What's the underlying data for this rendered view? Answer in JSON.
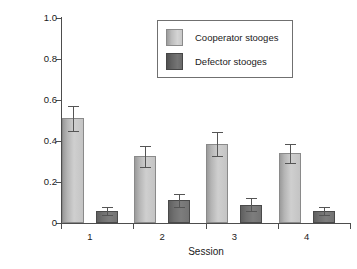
{
  "chart_data": {
    "type": "bar",
    "title": "",
    "xlabel": "Session",
    "ylabel": "Frequency of pulls",
    "categories": [
      "1",
      "2",
      "3",
      "4"
    ],
    "ylim": [
      0,
      1.0
    ],
    "ytick_labels": [
      "0",
      "0.2",
      "0.4",
      "0.6",
      "0.8",
      "1.0"
    ],
    "ytick_values": [
      0,
      0.2,
      0.4,
      0.6,
      0.8,
      1.0
    ],
    "grid": false,
    "legend_position": "upper center",
    "error_bars": "standard error",
    "series": [
      {
        "name": "Cooperator stooges",
        "color": "#c6c6c6",
        "values": [
          0.51,
          0.325,
          0.385,
          0.34
        ],
        "errors": [
          0.06,
          0.05,
          0.06,
          0.045
        ]
      },
      {
        "name": "Defector stooges",
        "color": "#6f6f6f",
        "values": [
          0.06,
          0.11,
          0.09,
          0.06
        ],
        "errors": [
          0.02,
          0.03,
          0.03,
          0.02
        ]
      }
    ]
  },
  "legend": {
    "entries": [
      {
        "label": "Cooperator stooges",
        "swatch": "cooperator-swatch"
      },
      {
        "label": "Defector stooges",
        "swatch": "defector-swatch"
      }
    ]
  },
  "axes": {
    "y_title": "Frequency of pulls",
    "x_title": "Session"
  }
}
